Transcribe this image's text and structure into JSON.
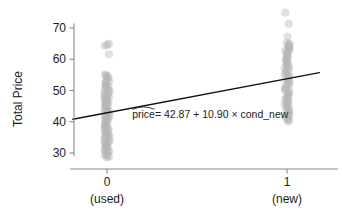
{
  "chart_data": {
    "type": "scatter",
    "title": "",
    "xlabel": "",
    "ylabel": "Total Price",
    "xlim": [
      -0.22,
      1.3
    ],
    "ylim": [
      27.2,
      76.5
    ],
    "grid": false,
    "legend": null,
    "x_ticks": [
      {
        "value": 0,
        "label": "0",
        "sublabel": "(used)"
      },
      {
        "value": 1,
        "label": "1",
        "sublabel": "(new)"
      }
    ],
    "y_ticks": [
      {
        "value": 30,
        "label": "30"
      },
      {
        "value": 40,
        "label": "40"
      },
      {
        "value": 50,
        "label": "50"
      },
      {
        "value": 60,
        "label": "60"
      },
      {
        "value": 70,
        "label": "70"
      }
    ],
    "annotation": {
      "text_parts": {
        "response": "price",
        "rest": " = 42.87 + 10.90 × cond_new"
      },
      "full_text": "price = 42.87 + 10.90 × cond_new",
      "hat_over": "price",
      "x": 0.14,
      "y": 41.3
    },
    "fit_line": {
      "intercept": 42.87,
      "slope": 10.9,
      "x_start": -0.19,
      "x_end": 1.18,
      "color": "#111111"
    },
    "series": [
      {
        "name": "cond_new = 0 (used)",
        "x_value": 0,
        "point_color": "#b4b4b4",
        "point_opacity": 0.42,
        "values": [
          64.9,
          64.6,
          64.3,
          61.6,
          55.2,
          54.8,
          54.6,
          54.3,
          54.0,
          53.5,
          53.0,
          52.6,
          52.3,
          51.9,
          51.5,
          51.2,
          50.9,
          50.5,
          50.2,
          49.9,
          49.6,
          49.3,
          49.0,
          48.7,
          48.4,
          48.0,
          47.7,
          47.4,
          47.1,
          46.8,
          46.5,
          46.2,
          45.9,
          45.6,
          45.3,
          45.0,
          44.7,
          44.4,
          44.1,
          43.8,
          43.5,
          43.2,
          42.9,
          42.6,
          42.3,
          42.0,
          41.7,
          41.4,
          41.1,
          40.8,
          40.5,
          40.2,
          39.9,
          39.6,
          39.3,
          39.0,
          38.7,
          38.4,
          38.1,
          37.8,
          37.5,
          37.2,
          36.9,
          36.6,
          36.3,
          36.0,
          35.7,
          35.4,
          35.1,
          34.8,
          34.5,
          34.2,
          33.9,
          33.6,
          33.3,
          33.0,
          32.7,
          32.4,
          32.1,
          31.8,
          31.5,
          31.2,
          30.9,
          30.6,
          30.3,
          30.0,
          29.7,
          29.4,
          29.1,
          28.8,
          28.6
        ]
      },
      {
        "name": "cond_new = 1 (new)",
        "x_value": 1,
        "point_color": "#b4b4b4",
        "point_opacity": 0.42,
        "values": [
          74.9,
          71.3,
          67.2,
          65.2,
          64.9,
          64.6,
          64.3,
          64.0,
          63.7,
          63.4,
          63.1,
          62.8,
          62.4,
          62.0,
          61.6,
          61.2,
          60.8,
          60.4,
          60.0,
          59.6,
          59.2,
          58.8,
          58.4,
          58.0,
          57.6,
          57.2,
          56.8,
          56.4,
          56.0,
          55.6,
          55.2,
          54.8,
          54.4,
          54.0,
          53.6,
          53.2,
          52.8,
          52.4,
          52.0,
          51.6,
          51.2,
          50.8,
          50.4,
          50.0,
          49.6,
          49.2,
          48.8,
          48.4,
          48.0,
          47.6,
          47.2,
          46.8,
          46.4,
          46.0,
          45.6,
          45.2,
          44.8,
          44.4,
          44.0,
          43.6,
          43.2,
          42.8,
          42.4,
          42.0,
          41.6,
          41.2,
          40.8,
          40.4,
          40.1
        ]
      }
    ]
  }
}
